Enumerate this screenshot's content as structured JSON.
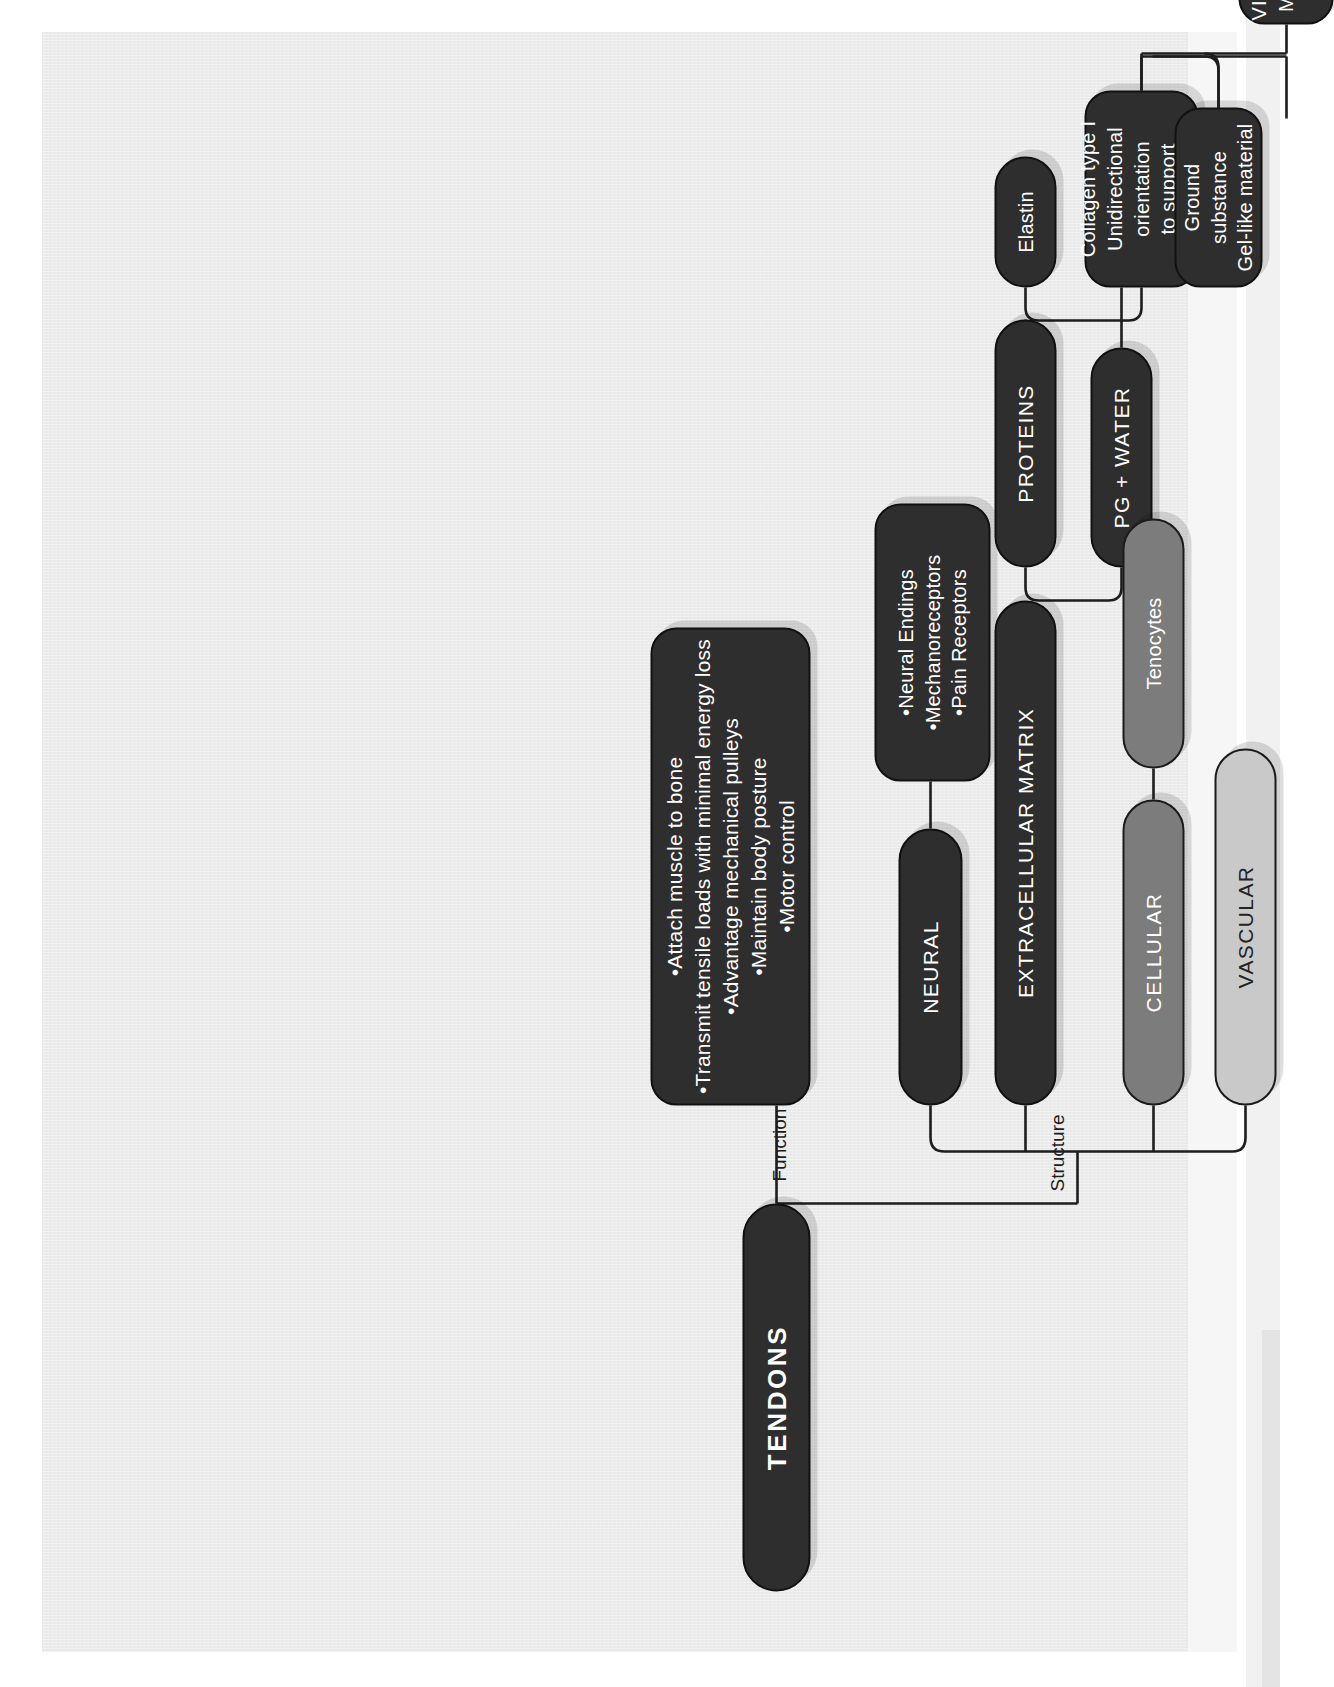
{
  "diagram": {
    "title": "TENDONS",
    "root": {
      "label": "TENDONS"
    },
    "edge_labels": {
      "function": "Function",
      "structure": "Structure"
    },
    "nodes": {
      "function": "•Attach muscle to bone\n•Transmit tensile loads with minimal energy loss\n•Advantage mechanical pulleys\n•Maintain body posture\n•Motor control",
      "neural": "NEURAL",
      "neural_sub": "•Neural Endings\n•Mechanoreceptors\n•Pain Receptors",
      "ecm": "EXTRACELLULAR MATRIX",
      "proteins": "PROTEINS",
      "elastin": "Elastin",
      "collagen": "Collagen type I\nUnidirectional\norientation\nto support\ntensile loads",
      "pg_water": "PG + WATER",
      "ground_substance": "Ground substance\nGel-like material",
      "viscoelastic": "VISCOELASTIC\nMECHANICAL\nPROPERTY",
      "cellular": "CELLULAR",
      "tenocytes": "Tenocytes",
      "vascular": "VASCULAR"
    },
    "colors": {
      "paper": "#ebebeb",
      "dark_node": "#2e2e2e",
      "mid_node": "#7c7c7c",
      "light_node": "#c9c9c9",
      "line": "#1d1d1d",
      "dark_text": "#232323",
      "light_text": "#ffffff"
    }
  }
}
